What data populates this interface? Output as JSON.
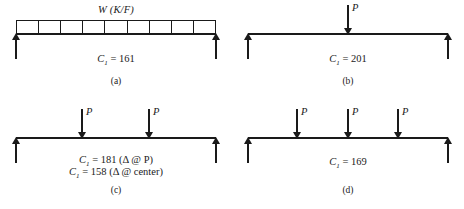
{
  "figure": {
    "panels": [
      {
        "id": "a",
        "caption": "(a)",
        "load_type": "distributed",
        "load_label": "W (K/F)",
        "load_cells": 9,
        "coefficient_lines": [
          {
            "symbol": "C",
            "subscript": "1",
            "equals": "=",
            "value": "161",
            "note": ""
          }
        ]
      },
      {
        "id": "b",
        "caption": "(b)",
        "load_type": "point",
        "point_loads": [
          {
            "label": "P",
            "position_pct": 50
          }
        ],
        "coefficient_lines": [
          {
            "symbol": "C",
            "subscript": "1",
            "equals": "=",
            "value": "201",
            "note": ""
          }
        ]
      },
      {
        "id": "c",
        "caption": "(c)",
        "load_type": "point",
        "point_loads": [
          {
            "label": "P",
            "position_pct": 33.3
          },
          {
            "label": "P",
            "position_pct": 66.6
          }
        ],
        "coefficient_lines": [
          {
            "symbol": "C",
            "subscript": "1",
            "equals": "=",
            "value": "181",
            "note": "(Δ @ P)"
          },
          {
            "symbol": "C",
            "subscript": "1",
            "equals": "=",
            "value": "158",
            "note": "(Δ @ center)"
          }
        ]
      },
      {
        "id": "d",
        "caption": "(d)",
        "load_type": "point",
        "point_loads": [
          {
            "label": "P",
            "position_pct": 25
          },
          {
            "label": "P",
            "position_pct": 50
          },
          {
            "label": "P",
            "position_pct": 75
          }
        ],
        "coefficient_lines": [
          {
            "symbol": "C",
            "subscript": "1",
            "equals": "=",
            "value": "169",
            "note": ""
          }
        ]
      }
    ],
    "colors": {
      "ink": "#1a1a1a",
      "background": "#ffffff"
    }
  }
}
